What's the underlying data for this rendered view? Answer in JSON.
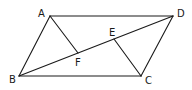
{
  "figure": {
    "type": "parallelogram",
    "points": {
      "A": {
        "x": 50,
        "y": 16,
        "label": "A",
        "lx": 38,
        "ly": 17
      },
      "D": {
        "x": 173,
        "y": 16,
        "label": "D",
        "lx": 177,
        "ly": 17
      },
      "B": {
        "x": 19,
        "y": 76,
        "label": "B",
        "lx": 9,
        "ly": 83
      },
      "C": {
        "x": 141,
        "y": 76,
        "label": "C",
        "lx": 145,
        "ly": 84
      },
      "E": {
        "x": 114,
        "y": 39,
        "label": "E",
        "lx": 109,
        "ly": 36
      },
      "F": {
        "x": 78,
        "y": 53,
        "label": "F",
        "lx": 75,
        "ly": 66
      }
    },
    "segments": [
      {
        "name": "AD",
        "from": "A",
        "to": "D"
      },
      {
        "name": "BC",
        "from": "B",
        "to": "C"
      },
      {
        "name": "AB",
        "from": "A",
        "to": "B"
      },
      {
        "name": "DC",
        "from": "D",
        "to": "C"
      },
      {
        "name": "BD",
        "from": "B",
        "to": "D"
      },
      {
        "name": "AF",
        "from": "A",
        "to": "F"
      },
      {
        "name": "CE",
        "from": "C",
        "to": "E"
      }
    ],
    "labels": {
      "A": "A",
      "B": "B",
      "C": "C",
      "D": "D",
      "E": "E",
      "F": "F"
    },
    "stroke_color": "#1a1a1a"
  }
}
